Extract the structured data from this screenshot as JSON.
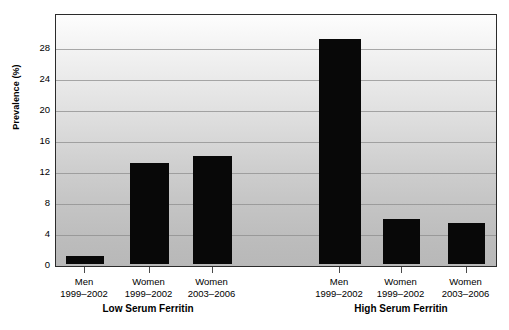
{
  "chart_data": {
    "type": "bar",
    "title": "",
    "xlabel": "",
    "ylabel": "Prevalence (%)",
    "ylim": [
      0,
      31.5
    ],
    "yticks": [
      0,
      4,
      8,
      12,
      16,
      20,
      24,
      28
    ],
    "ytick_labels": [
      "0",
      "4",
      "8",
      "12",
      "16",
      "20",
      "24",
      "28"
    ],
    "grid": true,
    "legend": "none",
    "categories": [
      "Men\n1999–2002",
      "Women\n1999–2002",
      "Women\n2003–2006",
      "Men\n1999–2002",
      "Women\n1999–2002",
      "Women\n2003–2006"
    ],
    "values": [
      1.0,
      13.0,
      14.0,
      29.0,
      5.8,
      5.3
    ],
    "groups": [
      "Low Serum Ferritin",
      "High Serum Ferritin"
    ],
    "bar_color": "#080808",
    "plot_bg_top": "#fdfdfd",
    "plot_bg_bottom": "#b8b8b8"
  },
  "axes": {
    "y_title": "Prevalence (%)",
    "ticks": [
      {
        "label": "28",
        "value": 28
      },
      {
        "label": "24",
        "value": 24
      },
      {
        "label": "20",
        "value": 20
      },
      {
        "label": "16",
        "value": 16
      },
      {
        "label": "12",
        "value": 12
      },
      {
        "label": "8",
        "value": 8
      },
      {
        "label": "4",
        "value": 4
      },
      {
        "label": "0",
        "value": 0
      }
    ]
  },
  "bars": [
    {
      "line1": "Men",
      "line2": "1999–2002",
      "value": 1.0,
      "group": "Low Serum Ferritin"
    },
    {
      "line1": "Women",
      "line2": "1999–2002",
      "value": 13.0,
      "group": "Low Serum Ferritin"
    },
    {
      "line1": "Women",
      "line2": "2003–2006",
      "value": 14.0,
      "group": "Low Serum Ferritin"
    },
    {
      "line1": "Men",
      "line2": "1999–2002",
      "value": 29.0,
      "group": "High Serum Ferritin"
    },
    {
      "line1": "Women",
      "line2": "1999–2002",
      "value": 5.8,
      "group": "High Serum Ferritin"
    },
    {
      "line1": "Women",
      "line2": "2003–2006",
      "value": 5.3,
      "group": "High Serum Ferritin"
    }
  ],
  "group_labels": [
    {
      "text": "Low Serum Ferritin"
    },
    {
      "text": "High Serum Ferritin"
    }
  ]
}
